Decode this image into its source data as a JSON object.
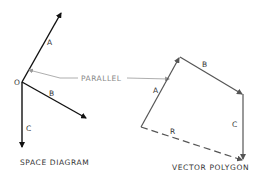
{
  "space_diagram": {
    "caption": "SPACE DIAGRAM",
    "origin_label": "O",
    "vectors": [
      {
        "label": "A"
      },
      {
        "label": "B"
      },
      {
        "label": "C"
      }
    ]
  },
  "parallel_annotation": {
    "label": "PARALLEL"
  },
  "vector_polygon": {
    "caption": "VECTOR POLYGON",
    "vectors": [
      {
        "label": "A"
      },
      {
        "label": "B"
      },
      {
        "label": "C"
      }
    ],
    "resultant": {
      "label": "R",
      "style": "dashed"
    }
  },
  "colors": {
    "space_lines": "#111111",
    "polygon_lines": "#555555",
    "annotation": "#999999"
  }
}
